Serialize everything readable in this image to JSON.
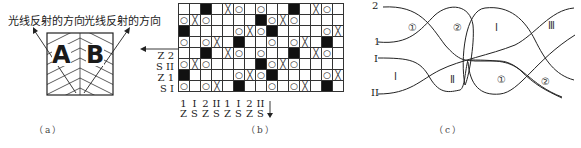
{
  "panel_a": {
    "left_label": "光线反射的方向",
    "right_label": "光线反射的方向",
    "letter_a": "A",
    "letter_b": "B",
    "caption": "（a）"
  },
  "panel_b": {
    "caption": "（b）",
    "legend_symbols": {
      "O": "○",
      "X": "╳",
      "B": "black"
    },
    "grid": [
      [
        "",
        "",
        "B",
        "",
        "X",
        "O",
        "",
        "O",
        "",
        "",
        "B",
        "",
        "X",
        "O",
        ""
      ],
      [
        "O",
        "X",
        "O",
        "",
        "",
        "",
        "",
        "B",
        "O",
        "X",
        "O",
        "",
        "",
        "",
        ""
      ],
      [
        "B",
        "",
        "",
        "",
        "",
        "O",
        "X",
        "O",
        "B",
        "",
        "",
        "",
        "",
        "O",
        "X"
      ],
      [
        "O",
        "",
        "O",
        "X",
        "",
        "B",
        "",
        "",
        "O",
        "",
        "O",
        "X",
        "",
        "B",
        ""
      ],
      [
        "",
        "",
        "B",
        "",
        "X",
        "O",
        "",
        "O",
        "",
        "",
        "B",
        "",
        "X",
        "O",
        ""
      ],
      [
        "O",
        "X",
        "O",
        "",
        "",
        "",
        "",
        "B",
        "O",
        "X",
        "O",
        "",
        "",
        "",
        ""
      ],
      [
        "B",
        "",
        "",
        "",
        "",
        "O",
        "X",
        "O",
        "B",
        "",
        "",
        "",
        "",
        "O",
        "X"
      ],
      [
        "O",
        "",
        "O",
        "X",
        "",
        "B",
        "",
        "",
        "O",
        "",
        "O",
        "X",
        "",
        "B",
        ""
      ]
    ],
    "row_labels": [
      "Z 2",
      "S II",
      "Z 1",
      "S I"
    ],
    "col_labels": [
      {
        "top": "1",
        "bottom": "Z"
      },
      {
        "top": "I",
        "bottom": "S"
      },
      {
        "top": "2",
        "bottom": "Z"
      },
      {
        "top": "II",
        "bottom": "S"
      },
      {
        "top": "1",
        "bottom": "Z"
      },
      {
        "top": "I",
        "bottom": "S"
      },
      {
        "top": "2",
        "bottom": "Z"
      },
      {
        "top": "II",
        "bottom": "S"
      }
    ]
  },
  "panel_c": {
    "caption": "（c）",
    "curve_labels": [
      "2",
      "1",
      "I",
      "II"
    ],
    "regions": [
      {
        "label": "①",
        "x": 408,
        "y": 22
      },
      {
        "label": "②",
        "x": 453,
        "y": 22
      },
      {
        "label": "Ⅰ",
        "x": 495,
        "y": 22
      },
      {
        "label": "Ⅲ",
        "x": 548,
        "y": 20
      },
      {
        "label": "Ⅰ",
        "x": 394,
        "y": 71
      },
      {
        "label": "Ⅱ",
        "x": 450,
        "y": 74
      },
      {
        "label": "①",
        "x": 497,
        "y": 74
      },
      {
        "label": "②",
        "x": 541,
        "y": 76
      }
    ]
  }
}
